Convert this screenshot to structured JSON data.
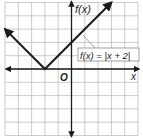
{
  "chart_data": {
    "type": "line",
    "title": "",
    "function_label": "f(x) = |x + 2|",
    "xlabel": "x",
    "ylabel": "f(x)",
    "origin_label": "O",
    "xlim": [
      -5,
      5
    ],
    "ylim": [
      -5,
      5
    ],
    "grid": true,
    "series": [
      {
        "name": "f(x) = |x + 2|",
        "x": [
          -5,
          -2,
          3
        ],
        "y": [
          3,
          0,
          5
        ]
      }
    ],
    "vertex": [
      -2,
      0
    ],
    "colors": {
      "curve": "#1a1a1a",
      "grid": "#b5b5b5",
      "axis": "#1a1a1a",
      "label_box_border": "#8a8a8a"
    }
  }
}
